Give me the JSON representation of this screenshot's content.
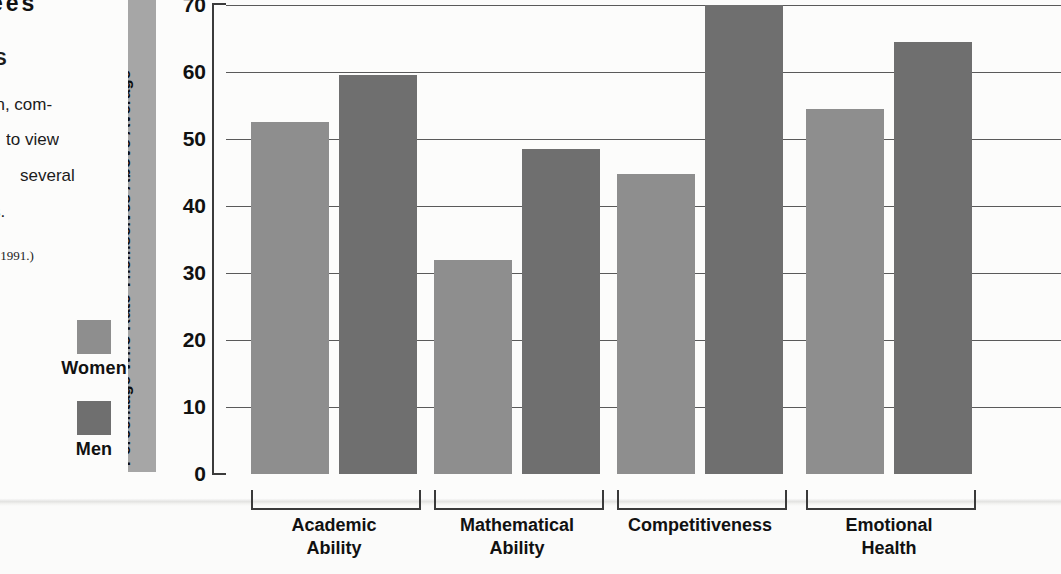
{
  "page": {
    "body_text_fragments": {
      "heading_fragment": "ees",
      "subheading_fragment": "S",
      "line1": "en, com-",
      "line2": "to view",
      "line3": "several",
      "line4": "s.",
      "source_fragment": "e, 1991.)"
    }
  },
  "legend": {
    "position": "left",
    "entries": [
      {
        "label": "Women",
        "color": "#8e8e8e",
        "swatch_name": "legend-swatch-women"
      },
      {
        "label": "Men",
        "color": "#6f6f6f",
        "swatch_name": "legend-swatch-men"
      }
    ]
  },
  "axis": {
    "y_title": "Percentage Who Rate Themselves Above Average",
    "y_title_band_color": "#a6a6a6",
    "tick_labels": [
      "70",
      "60",
      "50",
      "40",
      "30",
      "20",
      "10",
      "0"
    ]
  },
  "chart_data": {
    "type": "bar",
    "title": "",
    "xlabel": "",
    "ylabel": "Percentage Who Rate Themselves Above Average",
    "ylim": [
      0,
      70
    ],
    "yticks": [
      0,
      10,
      20,
      30,
      40,
      50,
      60,
      70
    ],
    "grid": true,
    "legend_position": "left",
    "categories": [
      "Academic Ability",
      "Mathematical Ability",
      "Competitiveness",
      "Emotional Health"
    ],
    "category_lines": [
      [
        "Academic",
        "Ability"
      ],
      [
        "Mathematical",
        "Ability"
      ],
      [
        "Competitiveness",
        ""
      ],
      [
        "Emotional",
        "Health"
      ]
    ],
    "series": [
      {
        "name": "Women",
        "color": "#8e8e8e",
        "values": [
          52.5,
          32,
          44.8,
          54.5
        ]
      },
      {
        "name": "Men",
        "color": "#6f6f6f",
        "values": [
          59.5,
          48.5,
          70,
          64.5
        ]
      }
    ]
  }
}
